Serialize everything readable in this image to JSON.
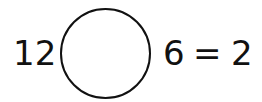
{
  "equation": {
    "left_operand": "12",
    "operator_blank": "",
    "right_operand": "6",
    "equals": "=",
    "result": "2"
  }
}
